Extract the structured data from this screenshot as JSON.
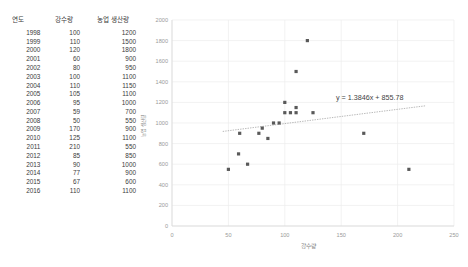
{
  "table": {
    "headers": [
      "연도",
      "강수량",
      "농업 생산량"
    ],
    "rows": [
      {
        "year": "1998",
        "rain": "100",
        "prod": "1200"
      },
      {
        "year": "1999",
        "rain": "110",
        "prod": "1500"
      },
      {
        "year": "2000",
        "rain": "120",
        "prod": "1800"
      },
      {
        "year": "2001",
        "rain": "60",
        "prod": "900"
      },
      {
        "year": "2002",
        "rain": "80",
        "prod": "950"
      },
      {
        "year": "2003",
        "rain": "100",
        "prod": "1100"
      },
      {
        "year": "2004",
        "rain": "110",
        "prod": "1150"
      },
      {
        "year": "2005",
        "rain": "105",
        "prod": "1100"
      },
      {
        "year": "2006",
        "rain": "95",
        "prod": "1000"
      },
      {
        "year": "2007",
        "rain": "59",
        "prod": "700"
      },
      {
        "year": "2008",
        "rain": "50",
        "prod": "550"
      },
      {
        "year": "2009",
        "rain": "170",
        "prod": "900"
      },
      {
        "year": "2010",
        "rain": "125",
        "prod": "1100"
      },
      {
        "year": "2011",
        "rain": "210",
        "prod": "550"
      },
      {
        "year": "2012",
        "rain": "85",
        "prod": "850"
      },
      {
        "year": "2013",
        "rain": "90",
        "prod": "1000"
      },
      {
        "year": "2014",
        "rain": "77",
        "prod": "900"
      },
      {
        "year": "2015",
        "rain": "67",
        "prod": "600"
      },
      {
        "year": "2016",
        "rain": "110",
        "prod": "1100"
      }
    ]
  },
  "chart_data": {
    "type": "scatter",
    "title": "",
    "xlabel": "강수량",
    "ylabel": "농업 생산량",
    "xlim": [
      0,
      250
    ],
    "ylim": [
      0,
      2000
    ],
    "xticks": [
      0,
      50,
      100,
      150,
      200,
      250
    ],
    "yticks": [
      0,
      200,
      400,
      600,
      800,
      1000,
      1200,
      1400,
      1600,
      1800,
      2000
    ],
    "grid": true,
    "legend": "none",
    "marker_color": "#595959",
    "trendline_color": "#9a9a9a",
    "points": [
      {
        "x": 100,
        "y": 1200,
        "label": "1998"
      },
      {
        "x": 110,
        "y": 1500,
        "label": "1999"
      },
      {
        "x": 120,
        "y": 1800,
        "label": "2000"
      },
      {
        "x": 60,
        "y": 900,
        "label": "2001"
      },
      {
        "x": 80,
        "y": 950,
        "label": "2002"
      },
      {
        "x": 100,
        "y": 1100,
        "label": "2003"
      },
      {
        "x": 110,
        "y": 1150,
        "label": "2004"
      },
      {
        "x": 105,
        "y": 1100,
        "label": "2005"
      },
      {
        "x": 95,
        "y": 1000,
        "label": "2006"
      },
      {
        "x": 59,
        "y": 700,
        "label": "2007"
      },
      {
        "x": 50,
        "y": 550,
        "label": "2008"
      },
      {
        "x": 170,
        "y": 900,
        "label": "2009"
      },
      {
        "x": 125,
        "y": 1100,
        "label": "2010"
      },
      {
        "x": 210,
        "y": 550,
        "label": "2011"
      },
      {
        "x": 85,
        "y": 850,
        "label": "2012"
      },
      {
        "x": 90,
        "y": 1000,
        "label": "2013"
      },
      {
        "x": 77,
        "y": 900,
        "label": "2014"
      },
      {
        "x": 67,
        "y": 600,
        "label": "2015"
      },
      {
        "x": 110,
        "y": 1100,
        "label": "2016"
      }
    ],
    "trendline": {
      "equation": "y = 1.3846x + 855.78",
      "slope": 1.3846,
      "intercept": 855.78,
      "x_start": 45,
      "x_end": 225
    }
  }
}
